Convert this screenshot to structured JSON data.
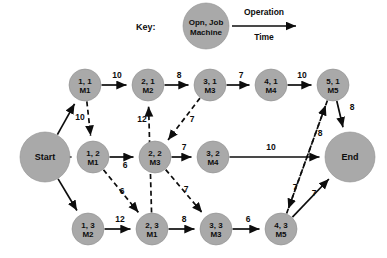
{
  "legend": {
    "key_label": "Key:",
    "node_line1": "Opn, Job",
    "node_line2": "Machine",
    "arrow_line1": "Operation",
    "arrow_line2": "Time",
    "node_cx": 206,
    "node_cy": 26,
    "node_r": 23,
    "key_x": 136,
    "key_y": 30,
    "arrow_x1": 232,
    "arrow_y1": 26,
    "arrow_x2": 296,
    "arrow_y2": 26,
    "arrow_t1_x": 264,
    "arrow_t1_y": 15,
    "arrow_t2_x": 264,
    "arrow_t2_y": 40
  },
  "style": {
    "node_fill": "#a9a9a9",
    "node_stroke": "#8f8f8f",
    "edge_color": "#0d0d0d",
    "background": "#ffffff"
  },
  "nodes": [
    {
      "id": "start",
      "label": "Start",
      "line1": "Start",
      "line2": "",
      "x": 45,
      "y": 157,
      "r": 25,
      "terminal": true
    },
    {
      "id": "end",
      "label": "End",
      "line1": "End",
      "line2": "",
      "x": 350,
      "y": 157,
      "r": 25,
      "terminal": true
    },
    {
      "id": "o11",
      "line1": "1, 1",
      "line2": "M1",
      "x": 85,
      "y": 85,
      "r": 16,
      "terminal": false
    },
    {
      "id": "o21",
      "line1": "2, 1",
      "line2": "M2",
      "x": 148,
      "y": 85,
      "r": 16,
      "terminal": false
    },
    {
      "id": "o31",
      "line1": "3, 1",
      "line2": "M3",
      "x": 210,
      "y": 85,
      "r": 16,
      "terminal": false
    },
    {
      "id": "o41",
      "line1": "4, 1",
      "line2": "M4",
      "x": 271,
      "y": 85,
      "r": 16,
      "terminal": false
    },
    {
      "id": "o51",
      "line1": "5, 1",
      "line2": "M5",
      "x": 333,
      "y": 85,
      "r": 16,
      "terminal": false
    },
    {
      "id": "o12",
      "line1": "1, 2",
      "line2": "M1",
      "x": 93,
      "y": 157,
      "r": 16,
      "terminal": false
    },
    {
      "id": "o22",
      "line1": "2, 2",
      "line2": "M3",
      "x": 155,
      "y": 157,
      "r": 16,
      "terminal": false
    },
    {
      "id": "o32",
      "line1": "3, 2",
      "line2": "M4",
      "x": 213,
      "y": 157,
      "r": 16,
      "terminal": false
    },
    {
      "id": "o13",
      "line1": "1, 3",
      "line2": "M2",
      "x": 88,
      "y": 229,
      "r": 16,
      "terminal": false
    },
    {
      "id": "o23",
      "line1": "2, 3",
      "line2": "M1",
      "x": 152,
      "y": 229,
      "r": 16,
      "terminal": false
    },
    {
      "id": "o33",
      "line1": "3, 3",
      "line2": "M3",
      "x": 216,
      "y": 229,
      "r": 16,
      "terminal": false
    },
    {
      "id": "o43",
      "line1": "4, 3",
      "line2": "M5",
      "x": 281,
      "y": 229,
      "r": 16,
      "terminal": false
    }
  ],
  "edges_solid": [
    {
      "from": "start",
      "to": "o11",
      "label": "",
      "lx": 0,
      "ly": 0
    },
    {
      "from": "start",
      "to": "o12",
      "label": "",
      "lx": 0,
      "ly": 0
    },
    {
      "from": "start",
      "to": "o13",
      "label": "",
      "lx": 0,
      "ly": 0
    },
    {
      "from": "o11",
      "to": "o21",
      "label": "10",
      "lx": 117,
      "ly": 78
    },
    {
      "from": "o21",
      "to": "o31",
      "label": "8",
      "lx": 179,
      "ly": 78
    },
    {
      "from": "o31",
      "to": "o41",
      "label": "7",
      "lx": 241,
      "ly": 78
    },
    {
      "from": "o41",
      "to": "o51",
      "label": "10",
      "lx": 302,
      "ly": 78
    },
    {
      "from": "o51",
      "to": "end",
      "label": "8",
      "lx": 352,
      "ly": 110
    },
    {
      "from": "o12",
      "to": "o22",
      "label": "6",
      "lx": 125,
      "ly": 168
    },
    {
      "from": "o22",
      "to": "o32",
      "label": "7",
      "lx": 184,
      "ly": 150
    },
    {
      "from": "o32",
      "to": "end",
      "label": "10",
      "lx": 271,
      "ly": 150
    },
    {
      "from": "o13",
      "to": "o23",
      "label": "12",
      "lx": 120,
      "ly": 222
    },
    {
      "from": "o23",
      "to": "o33",
      "label": "8",
      "lx": 184,
      "ly": 222
    },
    {
      "from": "o33",
      "to": "o43",
      "label": "6",
      "lx": 248,
      "ly": 222
    },
    {
      "from": "o43",
      "to": "end",
      "label": "7",
      "lx": 314,
      "ly": 196
    }
  ],
  "edges_dashed": [
    {
      "from": "o11",
      "to": "o12",
      "label": "10",
      "lx": 80,
      "ly": 120
    },
    {
      "from": "o23",
      "to": "o21",
      "label": "12",
      "lx": 142,
      "ly": 122
    },
    {
      "from": "o31",
      "to": "o22",
      "label": "7",
      "lx": 192,
      "ly": 122
    },
    {
      "from": "o12",
      "to": "o23",
      "label": "6",
      "lx": 122,
      "ly": 194
    },
    {
      "from": "o22",
      "to": "o33",
      "label": "7",
      "lx": 186,
      "ly": 192
    },
    {
      "from": "o43",
      "to": "o51",
      "label": "8",
      "lx": 320,
      "ly": 136
    },
    {
      "from": "o51",
      "to": "o43",
      "label": "7",
      "lx": 295,
      "ly": 190
    }
  ]
}
